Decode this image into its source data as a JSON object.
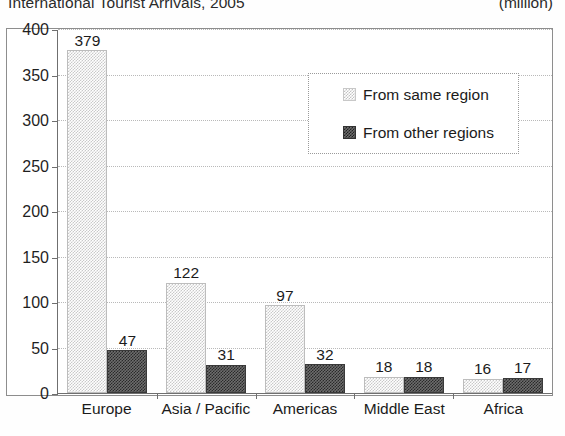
{
  "header": {
    "title": "International Tourist Arrivals, 2005",
    "unit": "(million)"
  },
  "legend": {
    "items": [
      {
        "label": "From same region",
        "swatch": "light-checker-swatch-icon"
      },
      {
        "label": "From other regions",
        "swatch": "dark-checker-swatch-icon"
      }
    ]
  },
  "chart_data": {
    "type": "bar",
    "title": "International Tourist Arrivals, 2005",
    "subtitle": "(million)",
    "xlabel": "",
    "ylabel": "",
    "unit": "million",
    "grid": true,
    "legend_position": "inside-top-right",
    "ylim": [
      0,
      400
    ],
    "yticks": [
      0,
      50,
      100,
      150,
      200,
      250,
      300,
      350,
      400
    ],
    "ytick_labels": [
      "0",
      "50",
      "100",
      "150",
      "200",
      "250",
      "300",
      "350",
      "400"
    ],
    "categories": [
      "Europe",
      "Asia / Pacific",
      "Americas",
      "Middle East",
      "Africa"
    ],
    "series": [
      {
        "name": "From same region",
        "values": [
          379,
          122,
          97,
          18,
          16
        ],
        "labels": [
          "379",
          "122",
          "97",
          "18",
          "16"
        ],
        "color": "#c9c9c9"
      },
      {
        "name": "From other regions",
        "values": [
          47,
          31,
          32,
          18,
          17
        ],
        "labels": [
          "47",
          "31",
          "32",
          "18",
          "17"
        ],
        "color": "#2a2a2a"
      }
    ]
  }
}
